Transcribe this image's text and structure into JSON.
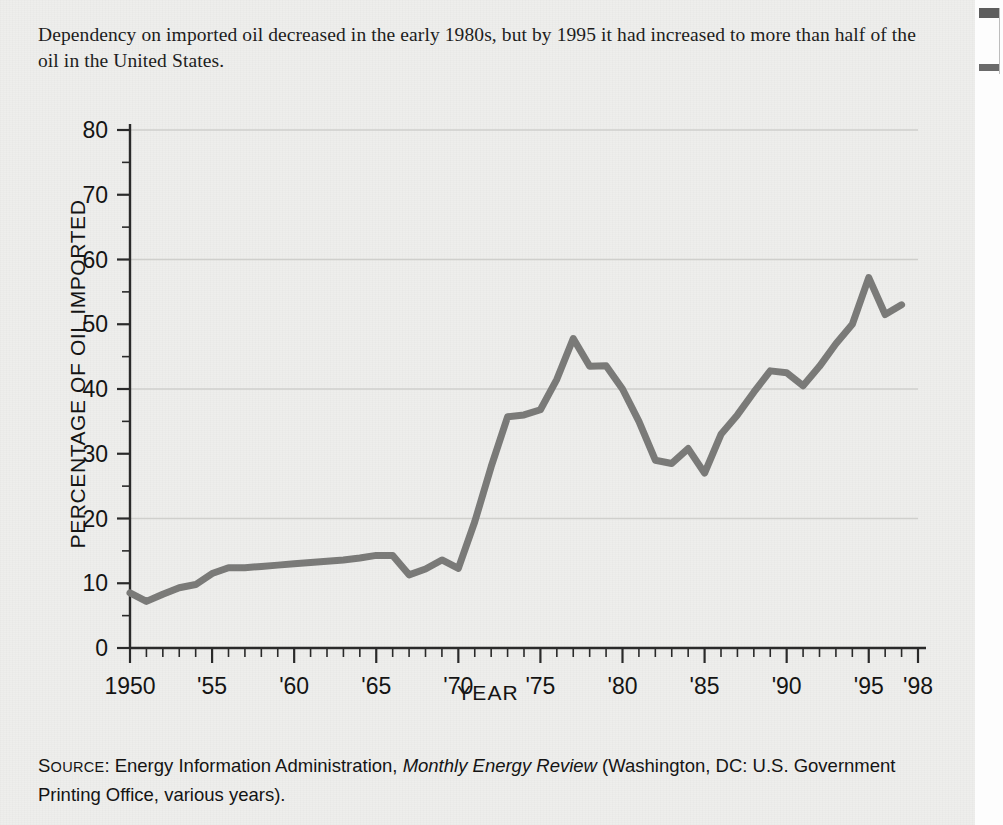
{
  "page": {
    "background_color": "#eeeeec",
    "lead_caption": "Dependency on imported oil decreased in the early 1980s, but by 1995 it had increased to more than half of the oil in the United States."
  },
  "source_note": {
    "label_source": "Source",
    "label_source_cap": "S",
    "label_source_rest": "OURCE",
    "text_before_italic": ": Energy Information Administration, ",
    "italic_title": "Monthly Energy Review",
    "text_after_italic": " (Washington, DC: U.S. Government Printing Office, various years)."
  },
  "chart_data": {
    "type": "line",
    "title": "",
    "xlabel": "YEAR",
    "ylabel": "PERCENTAGE OF OIL IMPORTED",
    "xlim": [
      1950,
      1998
    ],
    "ylim": [
      0,
      80
    ],
    "grid": true,
    "grid_values": [
      20,
      40,
      60,
      80
    ],
    "y_ticks_major": [
      0,
      10,
      20,
      30,
      40,
      50,
      60,
      70,
      80
    ],
    "y_tick_labels": [
      "0",
      "10",
      "20",
      "30",
      "40",
      "50",
      "60",
      "70",
      "80"
    ],
    "y_minor_step": 5,
    "x_ticks_major": [
      1950,
      1955,
      1960,
      1965,
      1970,
      1975,
      1980,
      1985,
      1990,
      1995,
      1998
    ],
    "x_tick_labels": [
      "1950",
      "'55",
      "'60",
      "'65",
      "'70",
      "'75",
      "'80",
      "'85",
      "'90",
      "'95",
      "'98"
    ],
    "x_minor_step": 1,
    "line_color": "#7a7a78",
    "line_width": 7,
    "legend": null,
    "series": [
      {
        "name": "Percentage of oil imported",
        "x": [
          1950,
          1951,
          1952,
          1953,
          1954,
          1955,
          1956,
          1957,
          1958,
          1959,
          1960,
          1961,
          1962,
          1963,
          1964,
          1965,
          1966,
          1967,
          1968,
          1969,
          1970,
          1971,
          1972,
          1973,
          1974,
          1975,
          1976,
          1977,
          1978,
          1979,
          1980,
          1981,
          1982,
          1983,
          1984,
          1985,
          1986,
          1987,
          1988,
          1989,
          1990,
          1991,
          1992,
          1993,
          1994,
          1995,
          1996,
          1997
        ],
        "values": [
          8.5,
          7.2,
          8.3,
          9.3,
          9.8,
          11.5,
          12.4,
          12.4,
          12.6,
          12.8,
          13.0,
          13.2,
          13.4,
          13.6,
          13.9,
          14.3,
          14.3,
          11.3,
          12.2,
          13.6,
          12.3,
          19.5,
          28.0,
          35.7,
          36.0,
          36.8,
          41.5,
          47.8,
          43.5,
          43.6,
          40.0,
          35.0,
          29.0,
          28.5,
          30.8,
          27.0,
          33.0,
          36.0,
          39.5,
          42.8,
          42.5,
          40.5,
          43.5,
          47.0,
          50.0,
          57.2,
          51.5,
          53.0
        ]
      }
    ]
  }
}
